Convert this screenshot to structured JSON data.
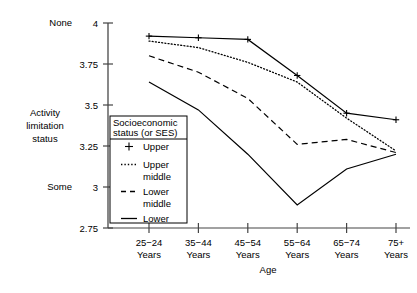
{
  "chart_data": {
    "type": "line",
    "title": "",
    "xlabel": "Age",
    "ylabel": "Activity limitation status",
    "categories": [
      "25−24\nYears",
      "35−44\nYears",
      "45−54\nYears",
      "55−64\nYears",
      "65−74\nYears",
      "75+\nYears"
    ],
    "category_lines": [
      [
        "25−24",
        "Years"
      ],
      [
        "35−44",
        "Years"
      ],
      [
        "45−54",
        "Years"
      ],
      [
        "55−64",
        "Years"
      ],
      [
        "65−74",
        "Years"
      ],
      [
        "75+",
        "Years"
      ]
    ],
    "ylim": [
      2.75,
      4
    ],
    "yticks": [
      2.75,
      3,
      3.25,
      3.5,
      3.75,
      4
    ],
    "ytick_labels": [
      "2.75",
      "3",
      "3.25",
      "3.5",
      "3.75",
      "4"
    ],
    "y_axis_anchor_high": "None",
    "y_axis_anchor_low": "Some",
    "grid": false,
    "legend_position": "inside-lower-left",
    "legend_title": "Socioeconomic status (or SES)",
    "legend_title_lines": [
      "Socioeconomic",
      "status (or SES)"
    ],
    "series": [
      {
        "name": "Upper",
        "label_lines": [
          "Upper"
        ],
        "style": "solid-plus",
        "marker": "plus",
        "color": "#000000",
        "values": [
          3.92,
          3.91,
          3.9,
          3.68,
          3.45,
          3.41
        ]
      },
      {
        "name": "Upper middle",
        "label_lines": [
          "Upper",
          "middle"
        ],
        "style": "dotted",
        "marker": "none",
        "color": "#000000",
        "values": [
          3.89,
          3.85,
          3.76,
          3.64,
          3.42,
          3.22
        ]
      },
      {
        "name": "Lower middle",
        "label_lines": [
          "Lower",
          "middle"
        ],
        "style": "dashed",
        "marker": "none",
        "color": "#000000",
        "values": [
          3.8,
          3.7,
          3.54,
          3.26,
          3.29,
          3.21
        ]
      },
      {
        "name": "Lower",
        "label_lines": [
          "Lower"
        ],
        "style": "solid",
        "marker": "none",
        "color": "#000000",
        "values": [
          3.64,
          3.47,
          3.2,
          2.89,
          3.11,
          3.2
        ]
      }
    ]
  },
  "axis": {
    "y_title_lines": [
      "Activity",
      "limitation",
      "status"
    ],
    "x_title": "Age"
  }
}
